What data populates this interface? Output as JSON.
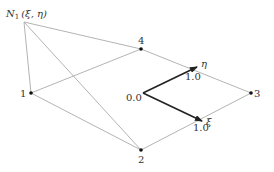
{
  "diagram": {
    "apex": {
      "label": "N",
      "subscript": "1",
      "args": "(ξ, η)",
      "x": 24,
      "y": 22
    },
    "nodes": [
      {
        "id": "1",
        "label": "1",
        "x": 31,
        "y": 93
      },
      {
        "id": "2",
        "label": "2",
        "x": 141,
        "y": 150
      },
      {
        "id": "3",
        "label": "3",
        "x": 251,
        "y": 93
      },
      {
        "id": "4",
        "label": "4",
        "x": 141,
        "y": 49
      }
    ],
    "origin": {
      "label": "0.0",
      "x": 143,
      "y": 93
    },
    "axes": [
      {
        "name": "xi",
        "symbol": "ξ",
        "tick_label": "1.0",
        "tip": [
          202,
          121
        ]
      },
      {
        "name": "eta",
        "symbol": "η",
        "tick_label": "1.0",
        "tip": [
          197,
          67
        ]
      }
    ],
    "edges": [
      [
        "apex",
        "1"
      ],
      [
        "apex",
        "4"
      ],
      [
        "apex",
        "2"
      ],
      [
        "1",
        "4"
      ],
      [
        "1",
        "2"
      ],
      [
        "4",
        "3"
      ],
      [
        "2",
        "3"
      ]
    ],
    "colors": {
      "edge": "#aaaaaa",
      "axis": "#222222",
      "node": "#111111"
    }
  }
}
